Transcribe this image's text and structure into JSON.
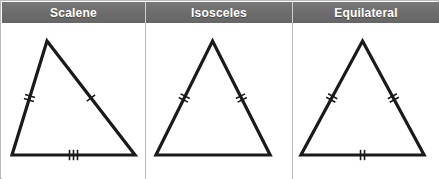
{
  "figure": {
    "width": 439,
    "height": 179,
    "border_color": "#b9b9b9",
    "header_bg_color": "#6c6c6c",
    "header_text_color": "#ffffff",
    "stroke_color": "#1a1a1a",
    "background_color": "#ffffff"
  },
  "columns": [
    {
      "id": "scalene",
      "label": "Scalene",
      "triangle": {
        "apex": [
          45,
          18
        ],
        "bottom_left": [
          10,
          132
        ],
        "bottom_right": [
          133,
          132
        ],
        "tick_counts": {
          "left": 2,
          "right": 1,
          "bottom": 3
        },
        "equal_sides": 0,
        "description": "All three sides different lengths"
      }
    },
    {
      "id": "isosceles",
      "label": "Isosceles",
      "triangle": {
        "apex": [
          67,
          18
        ],
        "bottom_left": [
          10,
          132
        ],
        "bottom_right": [
          125,
          132
        ],
        "tick_counts": {
          "left": 2,
          "right": 2,
          "bottom": 0
        },
        "equal_sides": 2,
        "description": "Two sides equal, marked with double ticks"
      }
    },
    {
      "id": "equilateral",
      "label": "Equilateral",
      "triangle": {
        "apex": [
          70,
          18
        ],
        "bottom_left": [
          8,
          132
        ],
        "bottom_right": [
          132,
          132
        ],
        "tick_counts": {
          "left": 2,
          "right": 2,
          "bottom": 2
        },
        "equal_sides": 3,
        "description": "All three sides equal, all marked with double ticks"
      }
    }
  ]
}
